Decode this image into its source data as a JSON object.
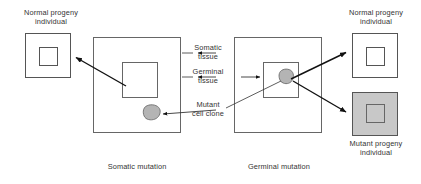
{
  "figure": {
    "title_visible": false,
    "colors": {
      "stroke": "#555555",
      "text": "#333333",
      "arrow": "#111111",
      "mutant_fill": "#c8c8c8",
      "clone_fill": "#b4b4b4",
      "background": "#ffffff"
    }
  },
  "labels": {
    "normal_progeny_left": "Normal progeny\nindividual",
    "normal_progeny_right": "Normal progeny\nindividual",
    "mutant_progeny_right": "Mutant progeny\nindividual",
    "somatic_tissue": "Somatic\ntissue",
    "germinal_tissue": "Germinal\ntissue",
    "mutant_cell_clone": "Mutant\ncell clone",
    "caption_somatic": "Somatic mutation",
    "caption_germinal": "Germinal mutation"
  },
  "shapes": {
    "progeny_left": {
      "x": 25,
      "y": 33,
      "w": 46,
      "h": 45,
      "fill": "none",
      "inner": {
        "x": 39,
        "y": 47,
        "w": 18,
        "h": 18
      }
    },
    "organism_somatic": {
      "x": 93,
      "y": 37,
      "w": 88,
      "h": 96,
      "fill": "none",
      "inner": {
        "x": 122,
        "y": 62,
        "w": 36,
        "h": 36
      }
    },
    "clone_somatic": {
      "cx": 152,
      "cy": 113,
      "r": 8
    },
    "organism_germinal": {
      "x": 234,
      "y": 37,
      "w": 88,
      "h": 96,
      "fill": "none",
      "inner": {
        "x": 263,
        "y": 62,
        "w": 36,
        "h": 36
      }
    },
    "clone_germinal": {
      "cx": 287,
      "cy": 76,
      "r": 7
    },
    "progeny_right_normal": {
      "x": 352,
      "y": 33,
      "w": 46,
      "h": 45,
      "fill": "none",
      "inner": {
        "x": 366,
        "y": 47,
        "w": 18,
        "h": 18
      }
    },
    "progeny_right_mutant": {
      "x": 352,
      "y": 92,
      "w": 46,
      "h": 44,
      "fill": "#c8c8c8",
      "inner": {
        "x": 366,
        "y": 105,
        "w": 18,
        "h": 18
      }
    }
  },
  "arrows": [
    {
      "name": "somatic-to-normal-progeny",
      "from": [
        124,
        86
      ],
      "to": [
        74,
        57
      ]
    },
    {
      "name": "germinal-to-normal-progeny",
      "from": [
        290,
        80
      ],
      "to": [
        348,
        52
      ]
    },
    {
      "name": "germinal-to-mutant-progeny",
      "from": [
        292,
        80
      ],
      "to": [
        348,
        112
      ]
    },
    {
      "name": "somatic-tissue-pointer",
      "from": [
        218,
        53
      ],
      "to": [
        190,
        53
      ]
    },
    {
      "name": "germinal-tissue-pointer-left",
      "from": [
        218,
        77
      ],
      "to": [
        190,
        77
      ]
    },
    {
      "name": "germinal-tissue-pointer-right",
      "from": [
        240,
        77
      ],
      "to": [
        262,
        77
      ]
    },
    {
      "name": "mutant-clone-pointer",
      "from": [
        215,
        108
      ],
      "to": [
        160,
        113
      ]
    }
  ],
  "leaders": [
    {
      "name": "somatic-tissue-leader",
      "points": "186,53 186,53"
    },
    {
      "name": "mutant-clone-leader",
      "points": "252,112 280,84"
    }
  ]
}
